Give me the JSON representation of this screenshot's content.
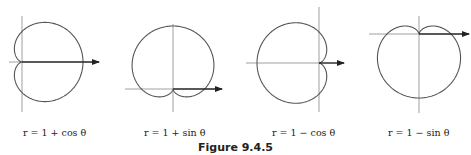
{
  "figure": {
    "label": "Figure 9.4.5"
  },
  "graphs": [
    {
      "id": "cardioid-1-plus-cos",
      "caption": "r = 1 + cos θ",
      "equation": "r = 1 + cos(theta)"
    },
    {
      "id": "cardioid-1-plus-sin",
      "caption": "r = 1 + sin θ",
      "equation": "r = 1 + sin(theta)"
    },
    {
      "id": "cardioid-1-minus-cos",
      "caption": "r = 1 − cos θ",
      "equation": "r = 1 - cos(theta)"
    },
    {
      "id": "cardioid-1-minus-sin",
      "caption": "r = 1 − sin θ",
      "equation": "r = 1 - sin(theta)"
    }
  ],
  "colors": {
    "curve": "#555555",
    "axis": "#777777",
    "arrow": "#222222",
    "text": "#222222"
  }
}
